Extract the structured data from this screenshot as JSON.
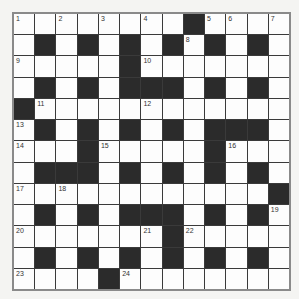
{
  "puzzle": {
    "type": "crossword",
    "size": 13,
    "rows": [
      "WWWWWWWWBWWWW",
      "WBWBWBWBWBWBW",
      "WWWWWBWWWWWWW",
      "WBWBWBBBWBWBW",
      "BWWWWWWWWWWWW",
      "WBWBWBWBWBBBW",
      "WWWBWWWWWBWWW",
      "WBBBWBWBWBWBW",
      "WWWWWWWWWWWWB",
      "WBWBWBBBWBWBW",
      "WWWWWWWBWWWWW",
      "WBWBWBWBWBWBW",
      "WWWWBWWWWWWWW"
    ],
    "numbers": [
      {
        "n": "1",
        "r": 0,
        "c": 0
      },
      {
        "n": "2",
        "r": 0,
        "c": 2
      },
      {
        "n": "3",
        "r": 0,
        "c": 4
      },
      {
        "n": "4",
        "r": 0,
        "c": 6
      },
      {
        "n": "5",
        "r": 0,
        "c": 9
      },
      {
        "n": "6",
        "r": 0,
        "c": 10
      },
      {
        "n": "7",
        "r": 0,
        "c": 12
      },
      {
        "n": "8",
        "r": 1,
        "c": 8
      },
      {
        "n": "9",
        "r": 2,
        "c": 0
      },
      {
        "n": "10",
        "r": 2,
        "c": 6
      },
      {
        "n": "11",
        "r": 4,
        "c": 1
      },
      {
        "n": "12",
        "r": 4,
        "c": 6
      },
      {
        "n": "13",
        "r": 5,
        "c": 0
      },
      {
        "n": "14",
        "r": 6,
        "c": 0
      },
      {
        "n": "15",
        "r": 6,
        "c": 4
      },
      {
        "n": "16",
        "r": 6,
        "c": 10
      },
      {
        "n": "17",
        "r": 8,
        "c": 0
      },
      {
        "n": "18",
        "r": 8,
        "c": 2
      },
      {
        "n": "19",
        "r": 9,
        "c": 12
      },
      {
        "n": "20",
        "r": 10,
        "c": 0
      },
      {
        "n": "21",
        "r": 10,
        "c": 6
      },
      {
        "n": "22",
        "r": 10,
        "c": 8
      },
      {
        "n": "23",
        "r": 12,
        "c": 0
      },
      {
        "n": "24",
        "r": 12,
        "c": 5
      }
    ]
  },
  "colors": {
    "black_square": "#2b2b2b",
    "white_square": "#fdfdfd",
    "border": "#8a8a8a",
    "background": "#f4f4f2"
  }
}
